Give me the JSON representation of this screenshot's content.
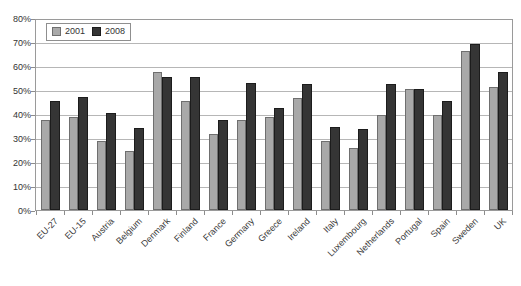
{
  "chart_data": {
    "type": "bar",
    "title": "",
    "subtitle": "",
    "xlabel": "",
    "ylabel": "",
    "ylim": [
      0,
      80
    ],
    "ytick_step": 10,
    "ytick_labels": [
      "0%",
      "10%",
      "20%",
      "30%",
      "40%",
      "50%",
      "60%",
      "70%",
      "80%"
    ],
    "grid": true,
    "legend_position": "top-left",
    "value_suffix": "%",
    "categories": [
      "EU-27",
      "EU-15",
      "Austria",
      "Belgium",
      "Denmark",
      "Finland",
      "France",
      "Germany",
      "Greece",
      "Ireland",
      "Italy",
      "Luxembourg",
      "Netherlands",
      "Portugal",
      "Spain",
      "Sweden",
      "UK"
    ],
    "series": [
      {
        "name": "2001",
        "color": "#a9a9a9",
        "values": [
          38,
          39,
          29,
          25,
          58,
          46,
          32,
          38,
          39,
          47,
          29,
          26,
          40,
          51,
          40,
          67,
          52
        ]
      },
      {
        "name": "2008",
        "color": "#353535",
        "values": [
          46,
          47.5,
          41,
          34.5,
          56,
          56,
          38,
          53.5,
          43,
          53,
          35,
          34,
          53,
          51,
          46,
          70,
          58
        ]
      }
    ]
  },
  "legend": {
    "items": [
      {
        "label": "2001",
        "swatch": "legend-swatch-2001"
      },
      {
        "label": "2008",
        "swatch": "legend-swatch-2008"
      }
    ]
  }
}
